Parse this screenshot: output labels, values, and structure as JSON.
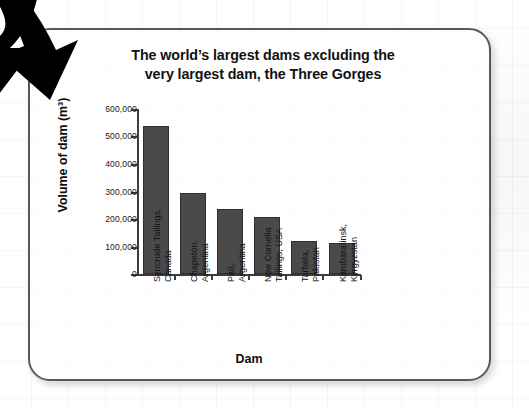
{
  "chart_data": {
    "type": "bar",
    "title_line1": "The world’s largest dams excluding the",
    "title_line2": "very largest dam, the Three Gorges",
    "xlabel": "Dam",
    "ylabel": "Volume of dam (m³)",
    "categories": [
      "Syncrude Tailings, Canada",
      "Chapetón, Argentina",
      "Pati, Argentina",
      "New Cornelia Tailings, USA",
      "Tarbela, Pakistan",
      "Kambaratinsk, Kyrgyzstan"
    ],
    "category_lines": [
      [
        "Syncrude Tailings,",
        "Canada"
      ],
      [
        "Chapetón,",
        "Argentina"
      ],
      [
        "Pati,",
        "Argentina"
      ],
      [
        "New Cornelia",
        "Tailings, USA"
      ],
      [
        "Tarbela,",
        "Pakistan"
      ],
      [
        "Kambaratinsk,",
        "Kyrgyzstan"
      ]
    ],
    "values": [
      540000,
      296000,
      238000,
      209000,
      121000,
      112000
    ],
    "ylim": [
      0,
      600000
    ],
    "ytick_values": [
      600000,
      500000,
      400000,
      300000,
      200000,
      100000,
      0
    ],
    "ytick_labels": [
      "600,000",
      "500,000",
      "400,000",
      "300,000",
      "200,000",
      "100,000",
      "0"
    ],
    "grid": false,
    "legend": "none",
    "bar_color": "#4a4a4a",
    "axis_color": "#3c3c3c"
  },
  "card": {
    "border_color": "#595959",
    "background": "#ffffff"
  },
  "decoration": {
    "arrow_name": "curved-down-right-arrow",
    "arrow_color": "#000000"
  }
}
